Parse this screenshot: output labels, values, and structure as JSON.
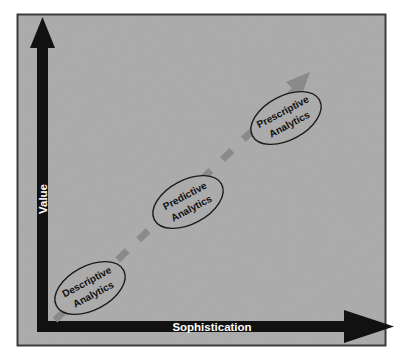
{
  "diagram": {
    "type": "concept-diagram",
    "background_color": "#ababab",
    "border_color": "#3c3c3c",
    "axis_color": "#111111",
    "arrow_color": "#8a8a8a",
    "ellipse_fill": "#ababab",
    "ellipse_stroke": "#1a1a1a",
    "axes": {
      "y": {
        "label": "Value",
        "label_color": "#ffffff",
        "orientation": "vertical",
        "arrow_direction": "up"
      },
      "x": {
        "label": "Sophistication",
        "label_color": "#ffffff",
        "orientation": "horizontal",
        "arrow_direction": "right"
      }
    },
    "trend_arrow": {
      "name": "maturity-trend-arrow",
      "style": "dashed",
      "direction": "up-right",
      "color": "#8a8a8a"
    },
    "stages": [
      {
        "id": "descriptive",
        "line1": "Descriptive",
        "line2": "Analytics",
        "cx": 90,
        "cy": 288,
        "rx": 38,
        "ry": 22,
        "rotation": -28
      },
      {
        "id": "predictive",
        "line1": "Predictive",
        "line2": "Analytics",
        "cx": 188,
        "cy": 202,
        "rx": 38,
        "ry": 22,
        "rotation": -28
      },
      {
        "id": "prescriptive",
        "line1": "Prescriptive",
        "line2": "Analytics",
        "cx": 286,
        "cy": 118,
        "rx": 38,
        "ry": 22,
        "rotation": -28
      }
    ]
  }
}
